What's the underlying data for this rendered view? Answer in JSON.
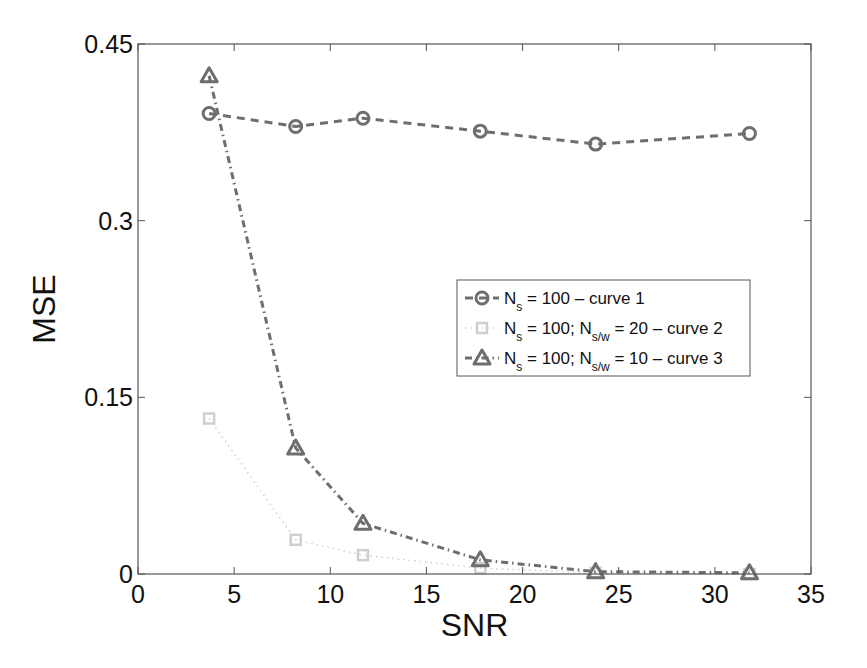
{
  "chart_data": {
    "type": "line",
    "title": "",
    "xlabel": "SNR",
    "ylabel": "MSE",
    "xlim": [
      0,
      35
    ],
    "ylim": [
      0,
      0.45
    ],
    "xticks": [
      0,
      5,
      10,
      15,
      20,
      25,
      30,
      35
    ],
    "yticks": [
      0,
      0.15,
      0.3,
      0.45
    ],
    "xtick_labels": [
      "0",
      "5",
      "10",
      "15",
      "20",
      "25",
      "30",
      "35"
    ],
    "ytick_labels": [
      "0",
      "0.15",
      "0.3",
      "0.45"
    ],
    "grid": false,
    "legend_position": "right-center",
    "series": [
      {
        "name": "N_s = 100 – curve 1",
        "legend": {
          "main": "N",
          "sub": "s",
          "rest": " = 100 – curve 1"
        },
        "marker": "circle",
        "line": "dashed",
        "color": "#6e6e6e",
        "x": [
          3.7,
          8.2,
          11.7,
          17.8,
          23.8,
          31.8
        ],
        "y": [
          0.391,
          0.38,
          0.387,
          0.376,
          0.365,
          0.374
        ]
      },
      {
        "name": "N_s = 100; N_s/w = 20 – curve 2",
        "legend": {
          "main": "N",
          "sub": "s",
          "mid": " = 100; N",
          "sub2": "s/w",
          "rest": " = 20 – curve 2"
        },
        "marker": "square",
        "line": "dotted",
        "color": "#cfcfcf",
        "x": [
          3.7,
          8.2,
          11.7,
          17.8,
          23.8,
          31.8
        ],
        "y": [
          0.132,
          0.029,
          0.016,
          0.005,
          0.001,
          0.0
        ]
      },
      {
        "name": "N_s = 100; N_s/w = 10 – curve 3",
        "legend": {
          "main": "N",
          "sub": "s",
          "mid": " = 100; N",
          "sub2": "s/w",
          "rest": " = 10 – curve 3"
        },
        "marker": "triangle",
        "line": "dashdot",
        "color": "#6e6e6e",
        "x": [
          3.7,
          8.2,
          11.7,
          17.8,
          23.8,
          31.8
        ],
        "y": [
          0.423,
          0.107,
          0.043,
          0.012,
          0.002,
          0.001
        ]
      }
    ]
  }
}
